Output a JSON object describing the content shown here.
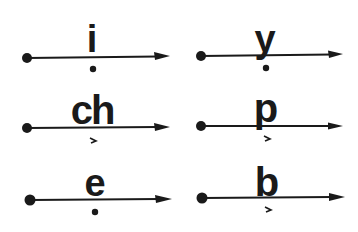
{
  "diagram": {
    "color": "#1a1a1a",
    "items": [
      {
        "id": "i",
        "letter": "i",
        "mark": "dot",
        "dot": [
          27,
          58
        ],
        "arrow_end": [
          170,
          56
        ],
        "letter_x": 92,
        "letter_y": 52,
        "mark_pos": [
          93,
          69
        ]
      },
      {
        "id": "y",
        "letter": "y",
        "mark": "dot",
        "dot": [
          201,
          56
        ],
        "arrow_end": [
          343,
          54
        ],
        "letter_x": 265,
        "letter_y": 52,
        "mark_pos": [
          266,
          68
        ]
      },
      {
        "id": "ch",
        "letter": "ch",
        "mark": "tick",
        "dot": [
          27,
          128
        ],
        "arrow_end": [
          170,
          127
        ],
        "letter_x": 92,
        "letter_y": 124,
        "mark_pos": [
          93,
          141
        ]
      },
      {
        "id": "p",
        "letter": "p",
        "mark": "tick",
        "dot": [
          201,
          126
        ],
        "arrow_end": [
          343,
          126
        ],
        "letter_x": 266,
        "letter_y": 122,
        "mark_pos": [
          267,
          139
        ]
      },
      {
        "id": "e",
        "letter": "e",
        "mark": "dot",
        "dot": [
          30,
          200
        ],
        "arrow_end": [
          172,
          199
        ],
        "letter_x": 95,
        "letter_y": 196,
        "mark_pos": [
          95,
          212
        ]
      },
      {
        "id": "b",
        "letter": "b",
        "mark": "tick",
        "dot": [
          202,
          198
        ],
        "arrow_end": [
          345,
          197
        ],
        "letter_x": 267,
        "letter_y": 196,
        "mark_pos": [
          268,
          210
        ]
      }
    ]
  }
}
